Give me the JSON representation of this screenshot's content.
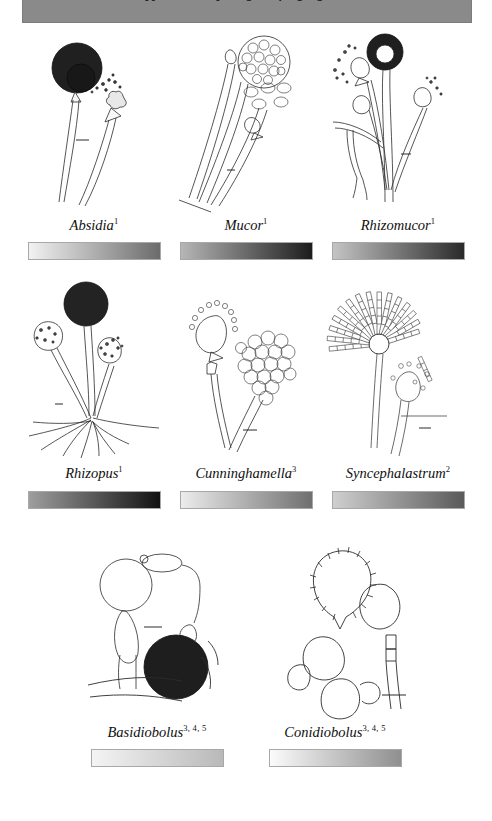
{
  "header": {
    "title": "opportunistic, pathogenic fungal genera",
    "background_color": "#8a8a8a"
  },
  "figure_caption_note": "",
  "specimens": [
    {
      "name": "Absidia",
      "refs": "1",
      "icon": "fungus-absidia-illustration",
      "gradient": {
        "from": "#f2f2f2",
        "to": "#6b6b6b"
      }
    },
    {
      "name": "Mucor",
      "refs": "1",
      "icon": "fungus-mucor-illustration",
      "gradient": {
        "from": "#b6b6b6",
        "to": "#1c1c1c"
      }
    },
    {
      "name": "Rhizomucor",
      "refs": "1",
      "icon": "fungus-rhizomucor-illustration",
      "gradient": {
        "from": "#c4c4c4",
        "to": "#2a2a2a"
      }
    },
    {
      "name": "Rhizopus",
      "refs": "1",
      "icon": "fungus-rhizopus-illustration",
      "gradient": {
        "from": "#9e9e9e",
        "to": "#111111"
      }
    },
    {
      "name": "Cunninghamella",
      "refs": "3",
      "icon": "fungus-cunninghamella-illustration",
      "gradient": {
        "from": "#ececec",
        "to": "#6f6f6f"
      }
    },
    {
      "name": "Syncephalastrum",
      "refs": "2",
      "icon": "fungus-syncephalastrum-illustration",
      "gradient": {
        "from": "#cfcfcf",
        "to": "#5a5a5a"
      }
    },
    {
      "name": "Basidiobolus",
      "refs": "3, 4, 5",
      "icon": "fungus-basidiobolus-illustration",
      "gradient": {
        "from": "#f4f4f4",
        "to": "#b9b9b9"
      }
    },
    {
      "name": "Conidiobolus",
      "refs": "3, 4, 5",
      "icon": "fungus-conidiobolus-illustration",
      "gradient": {
        "from": "#fbfbfb",
        "to": "#8f8f8f"
      }
    }
  ]
}
